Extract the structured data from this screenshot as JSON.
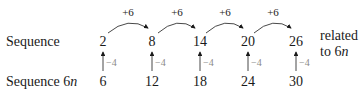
{
  "rows": {
    "top_label": "Sequence",
    "bottom_label_prefix": "Sequence 6",
    "bottom_label_var": "n"
  },
  "top_values": [
    "2",
    "8",
    "14",
    "20",
    "26"
  ],
  "bottom_values": [
    "6",
    "12",
    "18",
    "24",
    "30"
  ],
  "step_labels": [
    "+6",
    "+6",
    "+6",
    "+6"
  ],
  "offset_labels": [
    "−4",
    "−4",
    "−4",
    "−4",
    "−4"
  ],
  "side_note": {
    "line1": "related",
    "line2_prefix": "to 6",
    "line2_var": "n"
  },
  "colors": {
    "text": "#1a1a1a",
    "offset_label": "#8a8a8a",
    "arrow": "#1a1a1a"
  }
}
